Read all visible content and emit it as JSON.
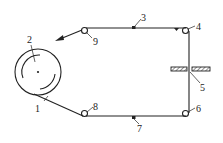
{
  "diagram": {
    "type": "belt/tape transport schematic",
    "colors": {
      "line": "#222222",
      "background": "#ffffff"
    },
    "components": [
      {
        "id": "1",
        "label": "1",
        "name": "belt/tape lead segment"
      },
      {
        "id": "2",
        "label": "2",
        "name": "supply drum/reel"
      },
      {
        "id": "3",
        "label": "3",
        "name": "top guide point"
      },
      {
        "id": "4",
        "label": "4",
        "name": "top-right roller"
      },
      {
        "id": "5",
        "label": "5",
        "name": "slotted plate (hatched)"
      },
      {
        "id": "6",
        "label": "6",
        "name": "bottom-right roller"
      },
      {
        "id": "7",
        "label": "7",
        "name": "bottom guide point"
      },
      {
        "id": "8",
        "label": "8",
        "name": "bottom-left roller"
      },
      {
        "id": "9",
        "label": "9",
        "name": "top-left roller with exit arrow"
      }
    ],
    "labels": {
      "l1": "1",
      "l2": "2",
      "l3": "3",
      "l4": "4",
      "l5": "5",
      "l6": "6",
      "l7": "7",
      "l8": "8",
      "l9": "9"
    }
  }
}
